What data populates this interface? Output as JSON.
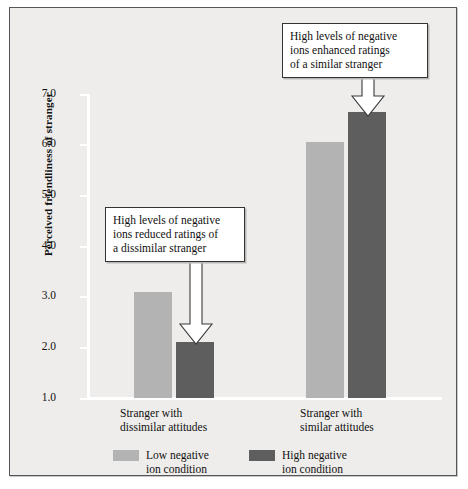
{
  "chart_data": {
    "type": "bar",
    "title": "",
    "xlabel": "",
    "ylabel": "Perceived friendliness of stranger",
    "ylim": [
      1.0,
      7.0
    ],
    "ytick_labels": [
      "7.0",
      "6.0",
      "5.0",
      "4.0",
      "3.0",
      "2.0",
      "1.0"
    ],
    "ytick_values": [
      7.0,
      6.0,
      5.0,
      4.0,
      3.0,
      2.0,
      1.0
    ],
    "grid": false,
    "legend_position": "bottom",
    "categories": [
      "Stranger with dissimilar attitudes",
      "Stranger with similar attitudes"
    ],
    "series": [
      {
        "name": "Low negative ion condition",
        "color": "#b3b3b3",
        "values": [
          3.1,
          6.05
        ]
      },
      {
        "name": "High negative ion condition",
        "color": "#5e5e5e",
        "values": [
          2.1,
          6.65
        ]
      }
    ],
    "annotations": [
      {
        "text": "High levels of negative ions reduced ratings of a dissimilar stranger",
        "points_to": "Stranger with dissimilar attitudes / High negative ion condition"
      },
      {
        "text": "High levels of negative ions enhanced ratings of a similar stranger",
        "points_to": "Stranger with similar attitudes / High negative ion condition"
      }
    ]
  },
  "categories": [
    {
      "line1": "Stranger with",
      "line2": "dissimilar attitudes"
    },
    {
      "line1": "Stranger with",
      "line2": "similar attitudes"
    }
  ],
  "legend": [
    {
      "label_line1": "Low negative",
      "label_line2": "ion condition",
      "color": "#b3b3b3"
    },
    {
      "label_line1": "High negative",
      "label_line2": "ion condition",
      "color": "#5e5e5e"
    }
  ],
  "callouts": {
    "left": {
      "line1": "High levels of negative",
      "line2": "ions reduced ratings of",
      "line3": "a dissimilar stranger"
    },
    "right": {
      "line1": "High levels of negative",
      "line2": "ions enhanced ratings",
      "line3": "of a similar stranger"
    }
  },
  "axis": {
    "y_title": "Perceived friendliness of stranger",
    "ticks": [
      "7.0",
      "6.0",
      "5.0",
      "4.0",
      "3.0",
      "2.0",
      "1.0"
    ]
  },
  "colors": {
    "light_bar": "#b3b3b3",
    "dark_bar": "#5e5e5e",
    "panel": "#eeedeb",
    "frame": "#55565a"
  }
}
